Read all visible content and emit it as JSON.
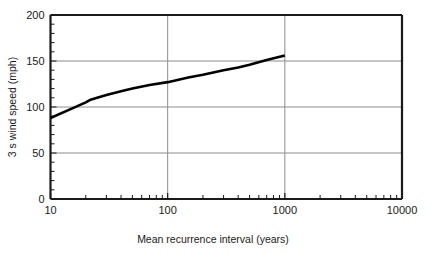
{
  "chart_data": {
    "type": "line",
    "title": "",
    "xlabel": "Mean recurrence interval (years)",
    "ylabel": "3 s wind speed (mph)",
    "xscale": "log",
    "yscale": "linear",
    "xlim": [
      10,
      10000
    ],
    "ylim": [
      0,
      200
    ],
    "grid": true,
    "legend": "none",
    "xticks": [
      10,
      100,
      1000,
      10000
    ],
    "xtick_labels": [
      "10",
      "100",
      "1000",
      "10000"
    ],
    "yticks": [
      0,
      50,
      100,
      150,
      200
    ],
    "ytick_labels": [
      "0",
      "50",
      "100",
      "150",
      "200"
    ],
    "x_minor_ticks": [
      20,
      30,
      40,
      50,
      60,
      70,
      80,
      90,
      200,
      300,
      400,
      500,
      600,
      700,
      800,
      900,
      2000,
      3000,
      4000,
      5000,
      6000,
      7000,
      8000,
      9000
    ],
    "y_minor_tick_step": 10,
    "series": [
      {
        "name": "3 s wind speed",
        "color": "#000000",
        "line_width": 2.6,
        "x": [
          10,
          15,
          20,
          22,
          25,
          30,
          40,
          50,
          70,
          100,
          150,
          200,
          300,
          400,
          500,
          700,
          1000
        ],
        "values": [
          88,
          98,
          105,
          108,
          110,
          113,
          117,
          120,
          124,
          127,
          132,
          135,
          140,
          143,
          146,
          151,
          156
        ]
      }
    ],
    "annotations": []
  },
  "axes": {
    "x_label": "Mean recurrence interval (years)",
    "y_label": "3 s wind speed (mph)"
  },
  "colors": {
    "curve": "#000000",
    "frame": "#1a1a1a",
    "grid": "#8c8c8c",
    "background": "#ffffff",
    "text": "#1a1a1a"
  }
}
